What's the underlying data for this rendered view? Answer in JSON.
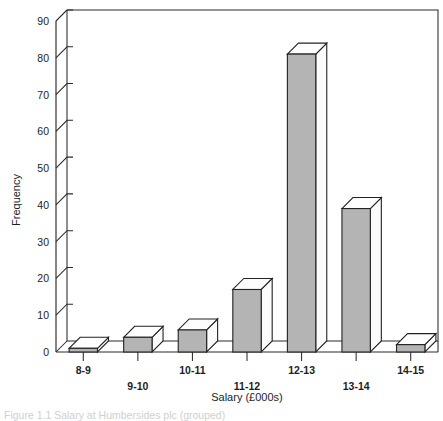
{
  "figure": {
    "caption": "Figure 1.1   Salary at Humbersides plc (grouped)"
  },
  "chart_data": {
    "type": "bar",
    "title": "",
    "subtitle": "",
    "xlabel": "Salary (£000s)",
    "ylabel": "Frequency",
    "categories": [
      "8-9",
      "9-10",
      "10-11",
      "11-12",
      "12-13",
      "13-14",
      "14-15"
    ],
    "values": [
      1,
      4,
      6,
      17,
      81,
      39,
      2
    ],
    "ylim": [
      0,
      90
    ],
    "yticks": [
      0,
      10,
      20,
      30,
      40,
      50,
      60,
      70,
      80,
      90
    ],
    "ytick_labels": [
      "0",
      "10",
      "20",
      "30",
      "40",
      "50",
      "60",
      "70",
      "80",
      "90"
    ],
    "grid": false,
    "legend": null,
    "style": "3d-column",
    "bar_fill_color": "#b4b4b4",
    "bar_top_color": "#fdfdfd",
    "bar_edge_color": "#222222",
    "axis_color": "#2a2a2a",
    "background_color": "#ffffff",
    "xtick_label_stagger": [
      "upper",
      "lower",
      "upper",
      "lower",
      "upper",
      "lower",
      "upper"
    ]
  }
}
